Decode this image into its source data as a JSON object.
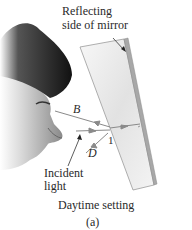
{
  "figure": {
    "labels": {
      "mirror_callout_line1": "Reflecting",
      "mirror_callout_line2": "side of mirror",
      "ray_b": "B",
      "ray_d": "D",
      "ray_1": "1",
      "incident_line1": "Incident",
      "incident_line2": "light",
      "caption": "Daytime setting",
      "panel": "(a)"
    },
    "colors": {
      "hair": "#1e1e1e",
      "skin": "#b8b8b8",
      "mirror_face": "#eeeeee",
      "mirror_edge": "#9a9a9a",
      "ray": "#8a8a8a"
    }
  }
}
